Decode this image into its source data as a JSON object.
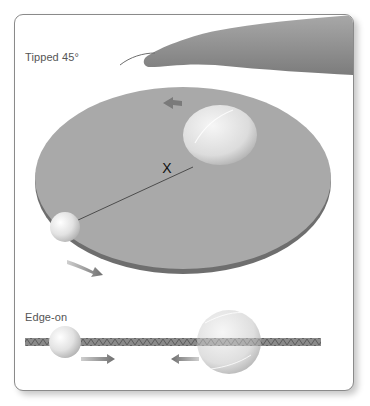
{
  "panels": {
    "top": {
      "label": "Tipped 45°"
    },
    "bottom": {
      "label": "Edge-on"
    }
  },
  "diagram": {
    "center_marker": "X",
    "objects": [
      "hand",
      "tipped-disk",
      "large-ball",
      "small-ball",
      "center-of-mass-marker",
      "axis-line",
      "motion-arrows"
    ],
    "colors": {
      "disk": "#a7a7a7",
      "disk_edge": "#6d6d6d",
      "ball": "#e6e6e6",
      "arrow": "#7a7a7a",
      "hand": "#8e8e8e"
    }
  }
}
